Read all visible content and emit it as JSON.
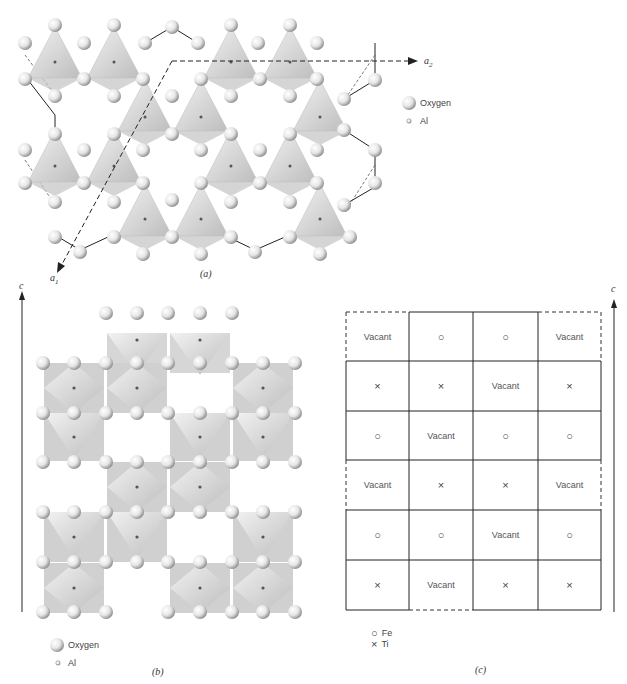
{
  "panel_a": {
    "label": "(a)",
    "axis_a1": "a",
    "axis_a1_sub": "1",
    "axis_a2": "a",
    "axis_a2_sub": "2",
    "legend": {
      "oxygen": "Oxygen",
      "al": "Al"
    }
  },
  "panel_b": {
    "label": "(b)",
    "axis_c": "c",
    "legend": {
      "oxygen": "Oxygen",
      "al": "Al"
    }
  },
  "panel_c": {
    "label": "(c)",
    "axis_c": "c",
    "legend": {
      "fe_symbol": "○",
      "fe": "Fe",
      "ti_symbol": "×",
      "ti": "Ti"
    },
    "grid": [
      [
        "Vacant",
        "○",
        "○",
        "Vacant"
      ],
      [
        "×",
        "×",
        "Vacant",
        "×"
      ],
      [
        "○",
        "Vacant",
        "○",
        "○"
      ],
      [
        "Vacant",
        "×",
        "×",
        "Vacant"
      ],
      [
        "○",
        "○",
        "Vacant",
        "○"
      ],
      [
        "×",
        "Vacant",
        "×",
        "×"
      ]
    ]
  }
}
